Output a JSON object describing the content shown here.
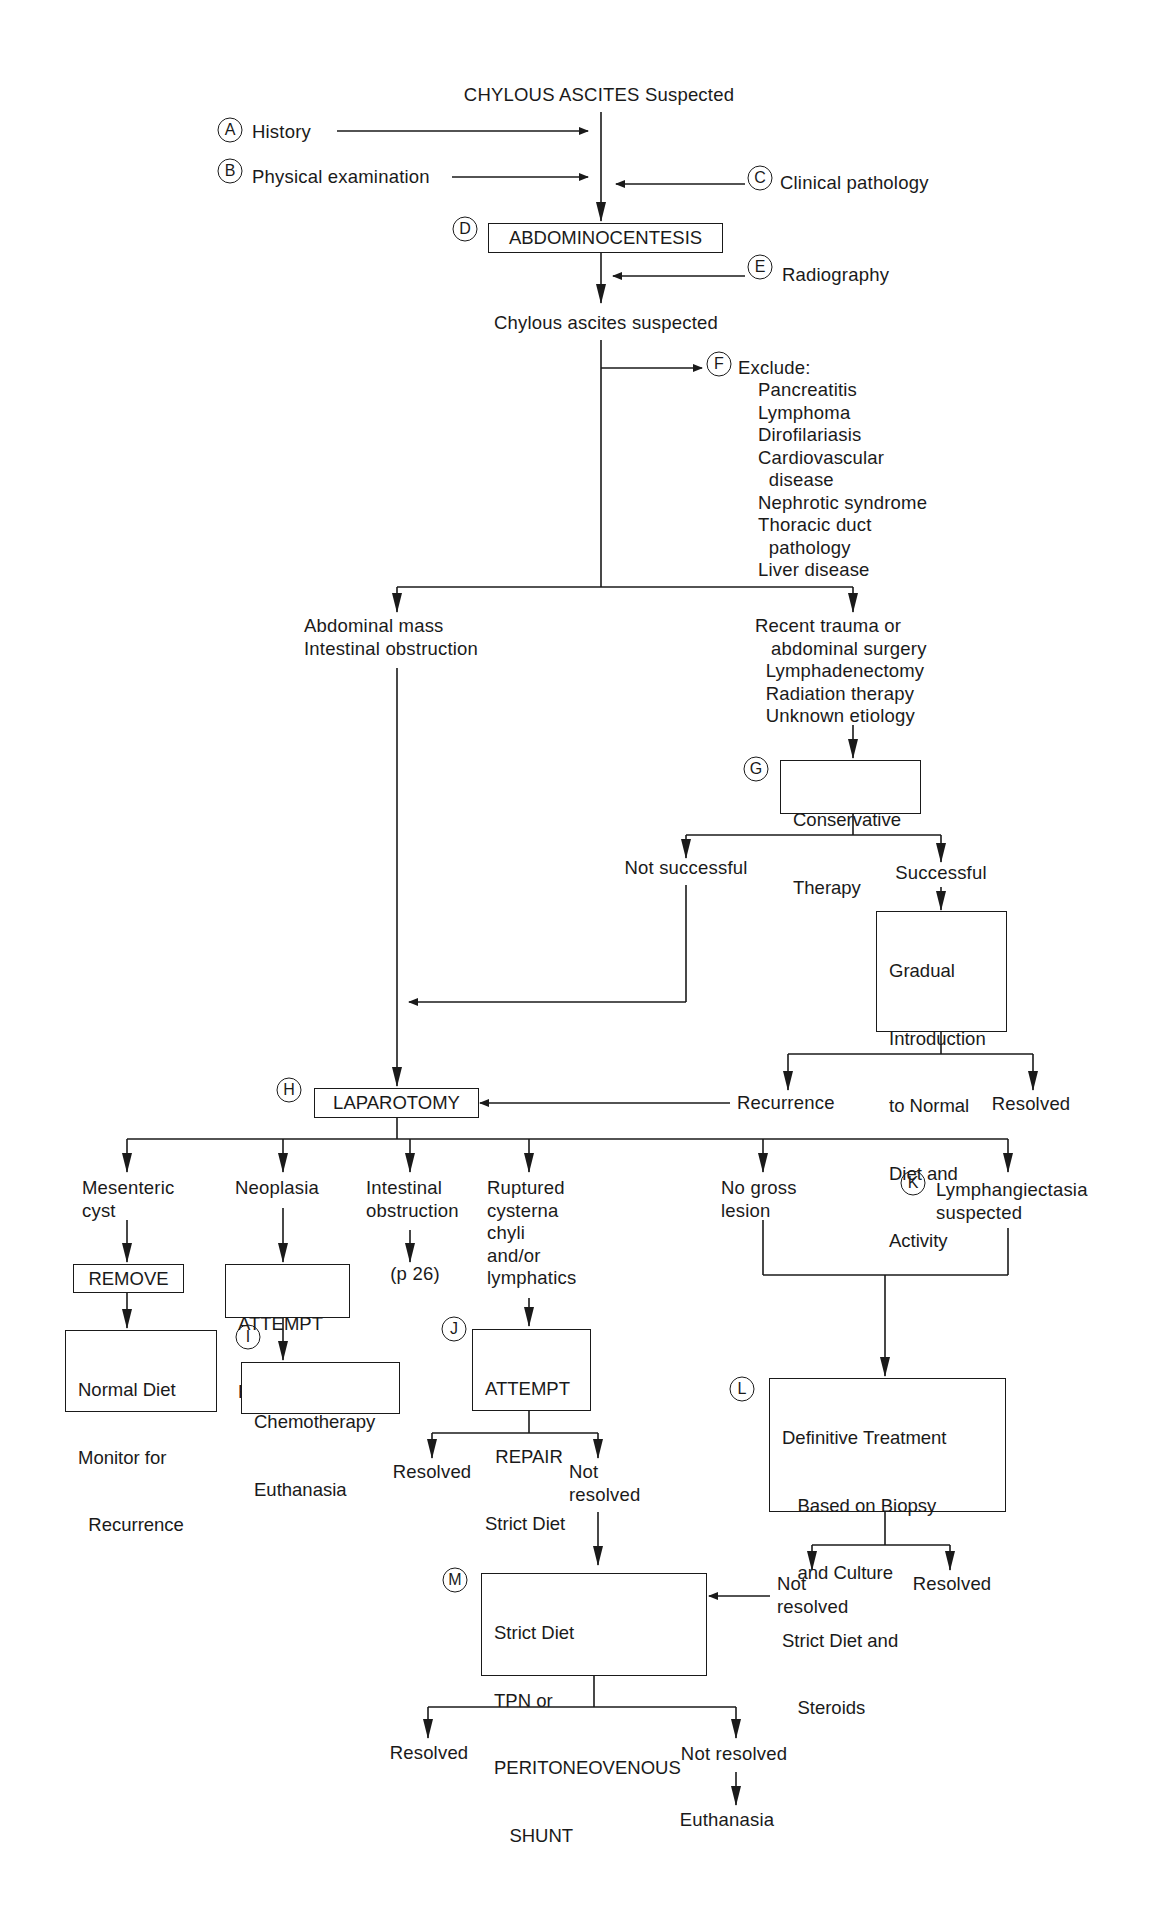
{
  "title": "CHYLOUS ASCITES Suspected",
  "inputs": {
    "A": {
      "marker": "A",
      "label": "History"
    },
    "B": {
      "marker": "B",
      "label": "Physical examination"
    },
    "C": {
      "marker": "C",
      "label": "Clinical pathology"
    },
    "E": {
      "marker": "E",
      "label": "Radiography"
    }
  },
  "abdominocentesis": {
    "marker": "D",
    "label": "ABDOMINOCENTESIS"
  },
  "chylous_suspected": "Chylous ascites suspected",
  "exclude": {
    "marker": "F",
    "heading": "Exclude:",
    "items": [
      "Pancreatitis",
      "Lymphoma",
      "Dirofilariasis",
      "Cardiovascular",
      "  disease",
      "Nephrotic syndrome",
      "Thoracic duct",
      "  pathology",
      "Liver disease"
    ]
  },
  "left_branch": [
    "Abdominal mass",
    "Intestinal obstruction"
  ],
  "right_branch": [
    "Recent trauma or",
    "   abdominal surgery",
    "  Lymphadenectomy",
    "  Radiation therapy",
    "  Unknown etiology"
  ],
  "conservative": {
    "marker": "G",
    "lines": [
      "Conservative",
      "Therapy"
    ]
  },
  "not_successful": "Not successful",
  "successful": "Successful",
  "gradual": {
    "lines": [
      "Gradual",
      "Introduction",
      "to Normal",
      "Diet and",
      "Activity"
    ]
  },
  "recurrence": "Recurrence",
  "resolved_top": "Resolved",
  "laparotomy": {
    "marker": "H",
    "label": "LAPAROTOMY"
  },
  "findings": {
    "mesenteric": [
      "Mesenteric",
      "cyst"
    ],
    "neoplasia": [
      "Neoplasia"
    ],
    "intestinal": [
      "Intestinal",
      "obstruction"
    ],
    "ruptured": [
      "Ruptured",
      "cysterna",
      "chyli",
      "and/or",
      "lymphatics"
    ],
    "no_gross": [
      "No gross",
      "lesion"
    ],
    "lymphangiectasia": {
      "marker": "K",
      "lines": [
        "Lymphangiectasia",
        "suspected"
      ]
    }
  },
  "remove": "REMOVE",
  "normal_diet": [
    "Normal Diet",
    "Monitor for",
    "  Recurrence"
  ],
  "attempt_removal": [
    "ATTEMPT",
    "REMOVAL"
  ],
  "chemo": {
    "marker": "I",
    "lines": [
      "Chemotherapy",
      "Euthanasia"
    ]
  },
  "page_ref": "(p 26)",
  "attempt_repair": {
    "marker": "J",
    "lines": [
      "ATTEMPT",
      "  REPAIR",
      "Strict Diet"
    ]
  },
  "repair_resolved": "Resolved",
  "repair_not_resolved": [
    "Not",
    "resolved"
  ],
  "definitive": {
    "marker": "L",
    "lines": [
      "Definitive Treatment",
      "   Based on Biopsy",
      "   and Culture",
      "Strict Diet and",
      "   Steroids"
    ]
  },
  "def_not_resolved": [
    "Not",
    "resolved"
  ],
  "def_resolved": "Resolved",
  "shunt": {
    "marker": "M",
    "lines": [
      "Strict Diet",
      "TPN or",
      "PERITONEOVENOUS",
      "   SHUNT"
    ]
  },
  "final_resolved": "Resolved",
  "final_not_resolved": "Not resolved",
  "euthanasia": "Euthanasia",
  "colors": {
    "ink": "#1a1a1a",
    "background": "#ffffff"
  }
}
